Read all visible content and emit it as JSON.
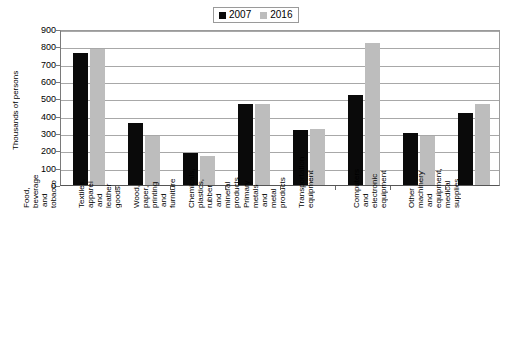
{
  "legend": {
    "position": "top-center",
    "entries": [
      {
        "label": "2007",
        "color": "#0a0a0a"
      },
      {
        "label": "2016",
        "color": "#bdbdbd"
      }
    ]
  },
  "axes": {
    "ylabel": "Thousands of persons",
    "yticks": [
      "0",
      "100",
      "200",
      "300",
      "400",
      "500",
      "600",
      "700",
      "800",
      "900"
    ],
    "xlabel": ""
  },
  "chart_data": {
    "type": "bar",
    "title": "",
    "subtitle": "",
    "xlabel": "",
    "ylabel": "Thousands of persons",
    "ylim": [
      0,
      900
    ],
    "ytick_step": 100,
    "grid": true,
    "legend_position": "top-center",
    "categories": [
      "Food, beverage and tobacco",
      "Textiles, apparel and leather goods",
      "Wood, paper, printing and furniture",
      "Chemicals, plastics, rubber and mineral products",
      "Primary metals and metal products",
      "Transportation equipment",
      "Computers and electronic equipment",
      "Other machinery and equipment, medical supplies"
    ],
    "series": [
      {
        "name": "2007",
        "color": "#0a0a0a",
        "values": [
          760,
          355,
          185,
          465,
          315,
          520,
          300,
          415
        ]
      },
      {
        "name": "2016",
        "color": "#bdbdbd",
        "values": [
          785,
          285,
          165,
          470,
          325,
          820,
          285,
          465
        ]
      }
    ]
  }
}
